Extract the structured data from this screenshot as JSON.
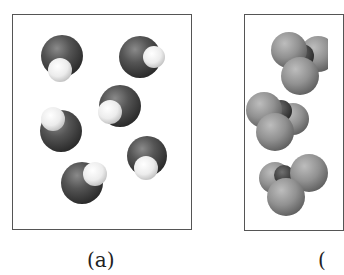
{
  "figure": {
    "panels": [
      {
        "id": "a",
        "label": "(a)",
        "description": "Six diatomic molecules, each with one large dark atom and one smaller white atom",
        "molecule_count": 6,
        "atom_colors": {
          "large_atom": "#4a4a4a",
          "small_atom": "#f2f2f2"
        }
      },
      {
        "id": "b",
        "label": "(",
        "description": "Tetrahedral-like molecules with a dark central atom and three gray outer atoms (panel partially cropped)",
        "molecule_count": 3,
        "atom_colors": {
          "central_atom": "#3c3c3c",
          "outer_atom": "#8e8e8e"
        }
      }
    ]
  },
  "colors": {
    "border": "#555555",
    "background": "#ffffff",
    "caption": "#222222"
  }
}
